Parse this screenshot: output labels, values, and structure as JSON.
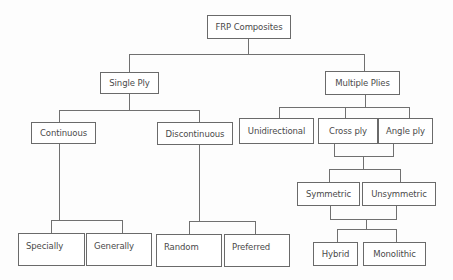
{
  "diagram": {
    "type": "tree",
    "title": "FRP Composites",
    "nodes": {
      "root": "FRP Composites",
      "single_ply": "Single Ply",
      "multiple_plies": "Multiple Plies",
      "continuous": "Continuous",
      "discontinuous": "Discontinuous",
      "unidirectional": "Unidirectional",
      "cross_ply": "Cross ply",
      "angle_ply": "Angle ply",
      "specially": "Specially",
      "generally": "Generally",
      "random": "Random",
      "preferred": "Preferred",
      "symmetric": "Symmetric",
      "unsymmetric": "Unsymmetric",
      "hybrid": "Hybrid",
      "monolithic": "Monolithic"
    },
    "edges": [
      [
        "FRP Composites",
        "Single Ply"
      ],
      [
        "FRP Composites",
        "Multiple Plies"
      ],
      [
        "Single Ply",
        "Continuous"
      ],
      [
        "Single Ply",
        "Discontinuous"
      ],
      [
        "Multiple Plies",
        "Unidirectional"
      ],
      [
        "Multiple Plies",
        "Cross ply"
      ],
      [
        "Multiple Plies",
        "Angle ply"
      ],
      [
        "Continuous",
        "Specially"
      ],
      [
        "Continuous",
        "Generally"
      ],
      [
        "Discontinuous",
        "Random"
      ],
      [
        "Discontinuous",
        "Preferred"
      ],
      [
        "Cross ply + Angle ply",
        "Symmetric"
      ],
      [
        "Cross ply + Angle ply",
        "Unsymmetric"
      ],
      [
        "Symmetric + Unsymmetric",
        "Hybrid"
      ],
      [
        "Symmetric + Unsymmetric",
        "Monolithic"
      ]
    ],
    "colors": {
      "line": "#707070",
      "border": "#6a6a6a",
      "text": "#4a4a4a",
      "background": "#ffffff"
    }
  }
}
